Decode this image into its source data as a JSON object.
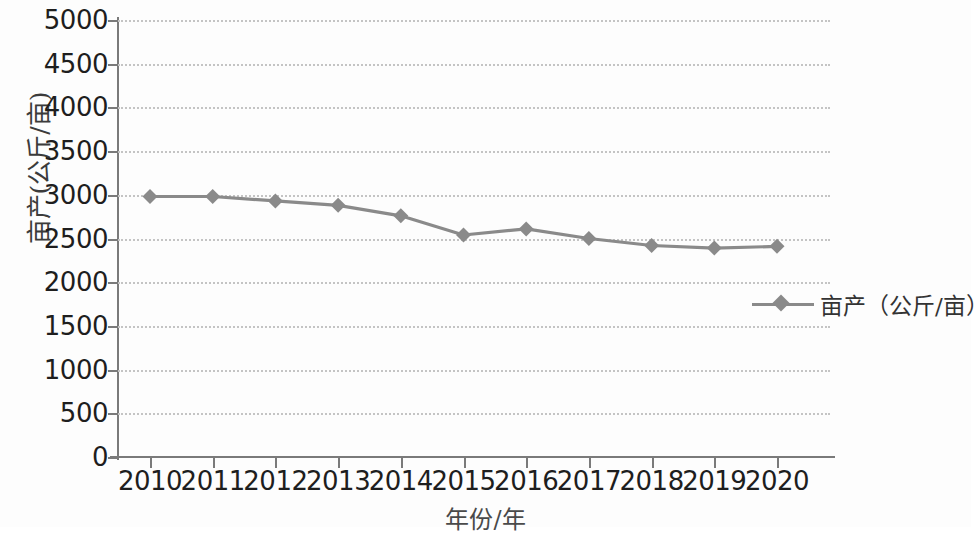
{
  "chart_data": {
    "type": "line",
    "title": "",
    "xlabel": "年份/年",
    "ylabel": "亩产(公斤/亩)",
    "categories": [
      "2010",
      "2011",
      "2012",
      "2013",
      "2014",
      "2015",
      "2016",
      "2017",
      "2018",
      "2019",
      "2020"
    ],
    "series": [
      {
        "name": "亩产（公斤/亩）",
        "values": [
          2980,
          2980,
          2930,
          2880,
          2760,
          2540,
          2610,
          2500,
          2420,
          2390,
          2410
        ],
        "color": "#8a8a8a",
        "marker": "diamond"
      }
    ],
    "ylim": [
      0,
      5000
    ],
    "y_ticks": [
      "0",
      "500",
      "1000",
      "1500",
      "2000",
      "2500",
      "3000",
      "3500",
      "4000",
      "4500",
      "5000"
    ],
    "y_tick_values": [
      0,
      500,
      1000,
      1500,
      2000,
      2500,
      3000,
      3500,
      4000,
      4500,
      5000
    ],
    "grid": true,
    "grid_style": "dotted-horizontal",
    "legend_position": "right-middle",
    "legend_entries": [
      "亩产（公斤/亩）"
    ]
  },
  "axes": {
    "y_title": "亩产(公斤/亩)",
    "x_title": "年份/年"
  },
  "colors": {
    "series": "#8a8a8a",
    "grid": "#c4c4c4",
    "axis": "#7a7a7a",
    "text": "#1e1e1e",
    "background": "#fdfdfd"
  }
}
